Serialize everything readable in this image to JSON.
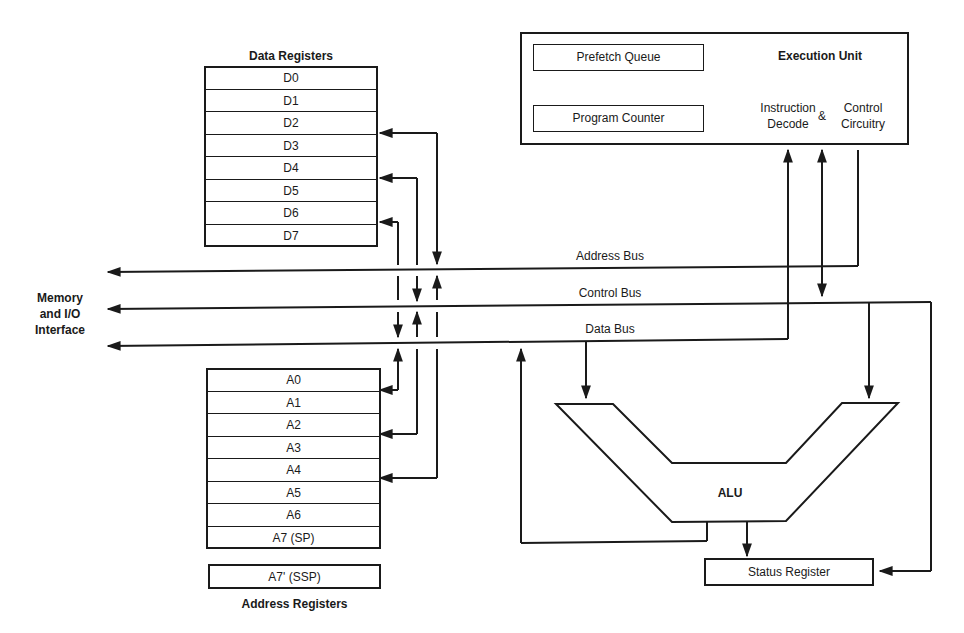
{
  "diagram": {
    "data_registers": {
      "title": "Data Registers",
      "items": [
        "D0",
        "D1",
        "D2",
        "D3",
        "D4",
        "D5",
        "D6",
        "D7"
      ]
    },
    "address_registers": {
      "title": "Address Registers",
      "items": [
        "A0",
        "A1",
        "A2",
        "A3",
        "A4",
        "A5",
        "A6",
        "A7 (SP)"
      ],
      "supervisor": "A7' (SSP)"
    },
    "execution_unit": {
      "title": "Execution Unit",
      "prefetch_queue": "Prefetch Queue",
      "program_counter": "Program Counter",
      "instruction_decode_line1": "Instruction",
      "instruction_decode_line2": "Decode",
      "ampersand": "&",
      "control_line1": "Control",
      "control_line2": "Circuitry"
    },
    "buses": {
      "address": "Address Bus",
      "control": "Control Bus",
      "data": "Data Bus"
    },
    "interface": {
      "line1": "Memory",
      "line2": "and I/O",
      "line3": "Interface"
    },
    "alu": "ALU",
    "status_register": "Status Register"
  }
}
